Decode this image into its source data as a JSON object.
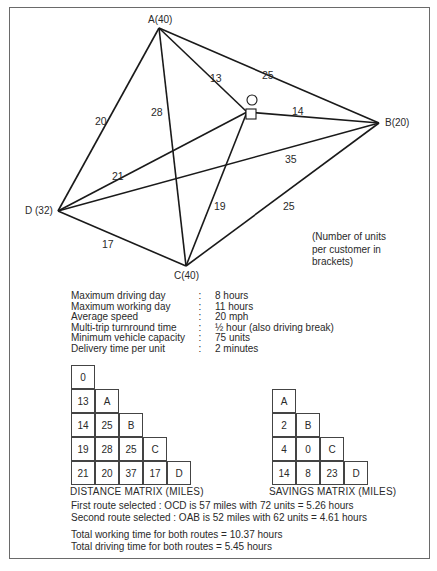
{
  "diagram": {
    "nodes": [
      {
        "id": "A",
        "label": "A(40)",
        "x": 159,
        "y": 28,
        "units": 40
      },
      {
        "id": "B",
        "label": "B(20)",
        "x": 379,
        "y": 123,
        "units": 20
      },
      {
        "id": "C",
        "label": "C(40)",
        "x": 186,
        "y": 266,
        "units": 40
      },
      {
        "id": "D",
        "label": "D (32)",
        "x": 58,
        "y": 211,
        "units": 32
      }
    ],
    "depot": {
      "label": "O",
      "x": 247,
      "y": 112
    },
    "edges": [
      {
        "from": "A",
        "to": "B",
        "distance": "25"
      },
      {
        "from": "A",
        "to": "O",
        "distance": "13"
      },
      {
        "from": "A",
        "to": "D",
        "distance": "20"
      },
      {
        "from": "A",
        "to": "C",
        "distance": "28"
      },
      {
        "from": "O",
        "to": "B",
        "distance": "14"
      },
      {
        "from": "O",
        "to": "D",
        "distance": "21"
      },
      {
        "from": "O",
        "to": "C",
        "distance": "19"
      },
      {
        "from": "B",
        "to": "D",
        "distance": "35"
      },
      {
        "from": "B",
        "to": "C",
        "distance": "25"
      },
      {
        "from": "D",
        "to": "C",
        "distance": "17"
      }
    ],
    "note": [
      "(Number of units",
      "per customer in",
      "brackets)"
    ]
  },
  "parameters": [
    {
      "label": "Maximum driving day",
      "value": "8 hours"
    },
    {
      "label": "Maximum working day",
      "value": "11 hours"
    },
    {
      "label": "Average speed",
      "value": "20 mph"
    },
    {
      "label": "Multi-trip turnround time",
      "value": "½ hour (also driving break)"
    },
    {
      "label": "Minimum vehicle capacity",
      "value": "75 units"
    },
    {
      "label": "Delivery time per unit",
      "value": "2 minutes"
    }
  ],
  "distance_matrix": {
    "caption": "DISTANCE MATRIX (MILES)",
    "rows": [
      [
        "0"
      ],
      [
        "13",
        "A"
      ],
      [
        "14",
        "25",
        "B"
      ],
      [
        "19",
        "28",
        "25",
        "C"
      ],
      [
        "21",
        "20",
        "37",
        "17",
        "D"
      ]
    ]
  },
  "savings_matrix": {
    "caption": "SAVINGS MATRIX (MILES)",
    "rows": [
      [
        "A"
      ],
      [
        "2",
        "B"
      ],
      [
        "4",
        "0",
        "C"
      ],
      [
        "14",
        "8",
        "23",
        "D"
      ]
    ]
  },
  "results": {
    "first_route": "First route selected : OCD is 57 miles with 72 units = 5.26 hours",
    "second_route": "Second route selected : OAB is 52 miles with 62 units = 4.61 hours",
    "total_working": "Total working time for both routes = 10.37 hours",
    "total_driving": "Total driving time for both routes =  5.45 hours"
  }
}
